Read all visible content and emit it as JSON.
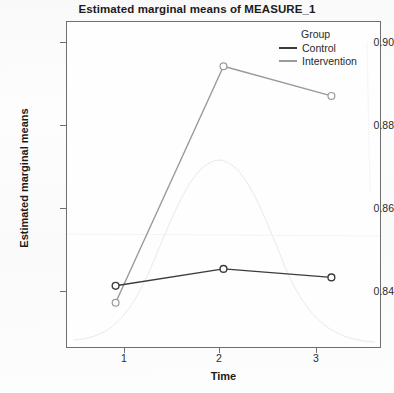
{
  "chart_data": {
    "type": "line",
    "title": "Estimated marginal means of MEASURE_1",
    "xlabel": "Time",
    "ylabel": "Estimated marginal means",
    "categories": [
      "1",
      "2",
      "3"
    ],
    "x": [
      1,
      2,
      3
    ],
    "xlim": [
      0.55,
      3.45
    ],
    "ylim": [
      0.8285,
      0.9055
    ],
    "yticks": [
      "0.90",
      "0.88",
      "0.86",
      "0.84"
    ],
    "ytick_values": [
      0.9,
      0.88,
      0.86,
      0.84
    ],
    "xticks": [
      "1",
      "2",
      "3"
    ],
    "grid": false,
    "legend_position": "top-right",
    "legend_title": "Group",
    "series": [
      {
        "name": "Control",
        "values": [
          0.843,
          0.847,
          0.845
        ],
        "color": "#3c3c3c",
        "marker": "circle"
      },
      {
        "name": "Intervention",
        "values": [
          0.839,
          0.895,
          0.888
        ],
        "color": "#9a9a9a",
        "marker": "circle"
      }
    ]
  },
  "legend": {
    "title": "Group",
    "entries": [
      {
        "label": "Control",
        "color": "#3c3c3c"
      },
      {
        "label": "Intervention",
        "color": "#9a9a9a"
      }
    ]
  },
  "axes": {
    "y": {
      "label": "Estimated marginal means",
      "ticks": [
        "0.90",
        "0.88",
        "0.86",
        "0.84"
      ]
    },
    "x": {
      "label": "Time",
      "ticks": [
        "1",
        "2",
        "3"
      ]
    }
  },
  "colors": {
    "control": "#3c3c3c",
    "intervention": "#9a9a9a",
    "frame": "#6f6f6f",
    "text": "#1c1c1c",
    "background": "#fdfdfd"
  }
}
